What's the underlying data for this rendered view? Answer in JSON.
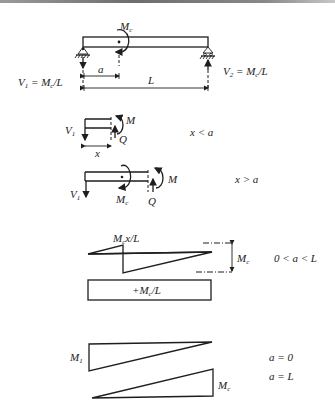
{
  "beam": {
    "moment_label": "M",
    "moment_sub": "c",
    "left_reaction": {
      "label": "V",
      "sub": "1",
      "rest": " = M",
      "rest_sub": "c",
      "tail": "/L"
    },
    "right_reaction": {
      "label": "V",
      "sub": "2",
      "rest": " = M",
      "rest_sub": "c",
      "tail": "/L"
    },
    "dim_a": "a",
    "dim_L": "L"
  },
  "section1": {
    "v_label": "V",
    "v_sub": "1",
    "m_label": "M",
    "q_label": "Q",
    "x_label": "x",
    "condition": "x < a"
  },
  "section2": {
    "v_label": "V",
    "v_sub": "1",
    "mc_label": "M",
    "mc_sub": "c",
    "m_label": "M",
    "q_label": "Q",
    "condition": "x > a"
  },
  "moment_diagram": {
    "label": "M",
    "label_sub": "c",
    "label_tail": "x/L",
    "height_label": "M",
    "height_sub": "c",
    "condition": "0 < a < L"
  },
  "shear_diagram": {
    "label_pre": "+M",
    "label_sub": "c",
    "label_tail": "/L"
  },
  "special_cases": {
    "left_label": "M",
    "left_sub": "1",
    "right_label": "M",
    "right_sub": "c",
    "case1": "a = 0",
    "case2": "a = L"
  }
}
